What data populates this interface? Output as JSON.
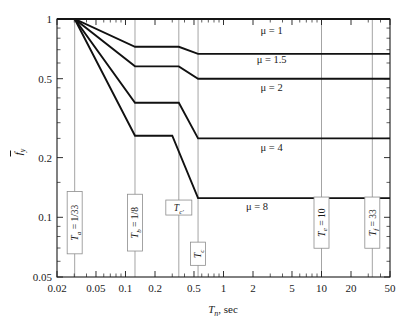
{
  "figure": {
    "name": "inelastic-design-spectrum-fy-vs-Tn",
    "background": "#ffffff"
  },
  "chart_data": {
    "type": "line",
    "title": "",
    "xlabel": "T , sec",
    "xlabel_main": "T",
    "xlabel_sub": "n",
    "xlabel_tail": ", sec",
    "ylabel_main": "f",
    "ylabel_sub": "y",
    "xscale": "log",
    "yscale": "log",
    "xlim": [
      0.02,
      50
    ],
    "ylim": [
      0.05,
      1
    ],
    "grid": false,
    "legend": "inline-annotations",
    "xticks": [
      0.02,
      0.05,
      0.1,
      0.2,
      0.5,
      1,
      2,
      5,
      10,
      20,
      50
    ],
    "xticklabels": [
      "0.02",
      "0.05",
      "0.1",
      "0.2",
      "0.5",
      "1",
      "2",
      "5",
      "10",
      "20",
      "50"
    ],
    "yticks": [
      1,
      0.5,
      0.2,
      0.1,
      0.05
    ],
    "yticklabels": [
      "1",
      "0.5",
      "0.2",
      "0.1",
      "0.05"
    ],
    "series": [
      {
        "name": "mu = 1",
        "label": "μ = 1",
        "label_x": 3.1,
        "label_y": 0.84,
        "points": [
          [
            0.02,
            1
          ],
          [
            0.0303,
            1
          ],
          [
            0.125,
            1
          ],
          [
            0.35,
            1
          ],
          [
            0.55,
            1
          ],
          [
            10,
            1
          ],
          [
            33,
            1
          ],
          [
            50,
            1
          ]
        ]
      },
      {
        "name": "mu = 1.5",
        "label": "μ = 1.5",
        "label_x": 3.1,
        "label_y": 0.6,
        "points": [
          [
            0.02,
            1
          ],
          [
            0.0303,
            1
          ],
          [
            0.125,
            0.724
          ],
          [
            0.35,
            0.724
          ],
          [
            0.55,
            0.667
          ],
          [
            10,
            0.667
          ],
          [
            33,
            0.667
          ],
          [
            50,
            0.667
          ]
        ]
      },
      {
        "name": "mu = 2",
        "label": "μ = 2",
        "label_x": 3.1,
        "label_y": 0.435,
        "points": [
          [
            0.02,
            1
          ],
          [
            0.0303,
            1
          ],
          [
            0.125,
            0.577
          ],
          [
            0.35,
            0.577
          ],
          [
            0.55,
            0.5
          ],
          [
            10,
            0.5
          ],
          [
            33,
            0.5
          ],
          [
            50,
            0.5
          ]
        ]
      },
      {
        "name": "mu = 4",
        "label": "μ = 4",
        "label_x": 3.1,
        "label_y": 0.216,
        "points": [
          [
            0.02,
            1
          ],
          [
            0.0303,
            1
          ],
          [
            0.125,
            0.378
          ],
          [
            0.35,
            0.378
          ],
          [
            0.55,
            0.25
          ],
          [
            10,
            0.25
          ],
          [
            33,
            0.25
          ],
          [
            50,
            0.25
          ]
        ]
      },
      {
        "name": "mu = 8",
        "label": "μ = 8",
        "label_x": 2.2,
        "label_y": 0.109,
        "points": [
          [
            0.02,
            1
          ],
          [
            0.0303,
            1
          ],
          [
            0.125,
            0.258
          ],
          [
            0.3,
            0.258
          ],
          [
            0.55,
            0.125
          ],
          [
            10,
            0.125
          ],
          [
            33,
            0.125
          ],
          [
            50,
            0.125
          ]
        ]
      }
    ],
    "vertical_lines": [
      {
        "name": "Ta",
        "x": 0.0303,
        "label_main": "T",
        "label_sub": "a",
        "label_tail": " = 1/33",
        "label_full": "Tₐ = 1/33",
        "orientation": "vertical-text",
        "box_y_center": 0.094
      },
      {
        "name": "Tb",
        "x": 0.125,
        "label_main": "T",
        "label_sub": "b",
        "label_tail": " = 1/8",
        "label_full": "Tᵇ = 1/8",
        "orientation": "vertical-text",
        "box_y_center": 0.094
      },
      {
        "name": "Tcprime",
        "x": 0.35,
        "label_main": "T",
        "label_sub": "c′",
        "label_tail": "",
        "label_full": "Tᶜ′",
        "orientation": "horizontal-text",
        "box_y_center": 0.112
      },
      {
        "name": "Tc",
        "x": 0.55,
        "label_main": "T",
        "label_sub": "c",
        "label_tail": "",
        "label_full": "Tᶜ",
        "orientation": "vertical-text",
        "box_y_center": 0.0655
      },
      {
        "name": "Te",
        "x": 10,
        "label_main": "T",
        "label_sub": "e",
        "label_tail": " = 10",
        "label_full": "Tₑ = 10",
        "orientation": "vertical-text",
        "box_y_center": 0.094
      },
      {
        "name": "Tf",
        "x": 33,
        "label_main": "T",
        "label_sub": "f",
        "label_tail": " = 33",
        "label_full": "T_f = 33",
        "orientation": "vertical-text",
        "box_y_center": 0.094
      }
    ]
  }
}
